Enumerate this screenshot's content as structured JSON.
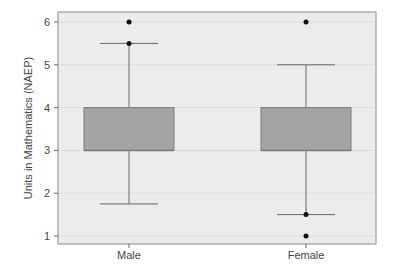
{
  "chart_data": {
    "type": "box",
    "title": "",
    "xlabel": "",
    "ylabel": "Units in Mathematics (NAEP)",
    "ylim": [
      0.75,
      6.35
    ],
    "yticks": [
      1,
      2,
      3,
      4,
      5,
      6
    ],
    "grid": true,
    "categories": [
      "Male",
      "Female"
    ],
    "series": [
      {
        "name": "Male",
        "q1": 3,
        "median": 3,
        "q3": 4,
        "whisker_low": 1.75,
        "whisker_high": 5.5,
        "outliers": [
          5.5,
          6
        ]
      },
      {
        "name": "Female",
        "q1": 3,
        "median": 3,
        "q3": 4,
        "whisker_low": 1.5,
        "whisker_high": 5,
        "outliers": [
          6,
          1.5,
          1
        ]
      }
    ],
    "colors": {
      "box_fill": "#a4a4a4",
      "box_stroke": "#7a7a7a",
      "panel_bg": "#ececec",
      "grid": "#dcdcdc",
      "whisker": "#666666",
      "outlier": "#111111"
    }
  }
}
